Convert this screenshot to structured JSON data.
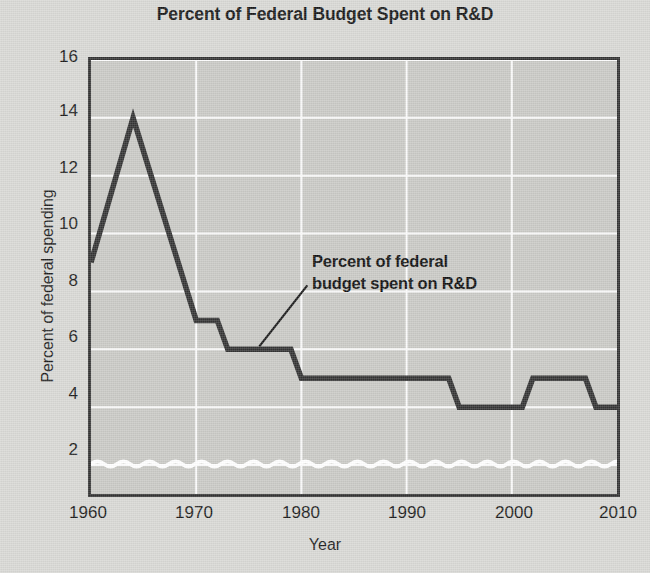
{
  "chart_data": {
    "type": "line",
    "title": "Percent of Federal Budget Spent on R&D",
    "xlabel": "Year",
    "ylabel": "Percent of federal spending",
    "xlim": [
      1960,
      2010
    ],
    "ylim": [
      1,
      16
    ],
    "grid": true,
    "legend_position": "none",
    "y_ticks": [
      2,
      4,
      6,
      8,
      10,
      12,
      14,
      16
    ],
    "x_ticks": [
      1960,
      1970,
      1980,
      1990,
      2000,
      2010
    ],
    "axis_break": "wavy white break near bottom of y-axis (axis does not start at zero)",
    "annotations": [
      {
        "text_line_1": "Percent of federal",
        "text_line_2": "budget spent on R&D",
        "points_to_year": 1976,
        "points_to_value": 6
      }
    ],
    "series": [
      {
        "name": "Percent of federal budget spent on R&D",
        "color": "#333333",
        "x": [
          1960,
          1964,
          1970,
          1972,
          1973,
          1979,
          1980,
          1994,
          1995,
          2001,
          2002,
          2007,
          2008,
          2010
        ],
        "values": [
          9,
          14,
          7,
          7,
          6,
          6,
          5,
          5,
          4,
          4,
          5,
          5,
          4,
          4
        ]
      }
    ]
  },
  "style": {
    "paper_color": "#d8d8d4",
    "plot_background": "#c9c9c5",
    "gridline_color": "#ffffff",
    "line_color": "#333333",
    "frame_color": "#333333",
    "text_color": "#1c1c1c"
  },
  "ticks": {
    "y": [
      "16",
      "14",
      "12",
      "10",
      "8",
      "6",
      "4",
      "2"
    ],
    "x": [
      "1960",
      "1970",
      "1980",
      "1990",
      "2000",
      "2010"
    ]
  }
}
